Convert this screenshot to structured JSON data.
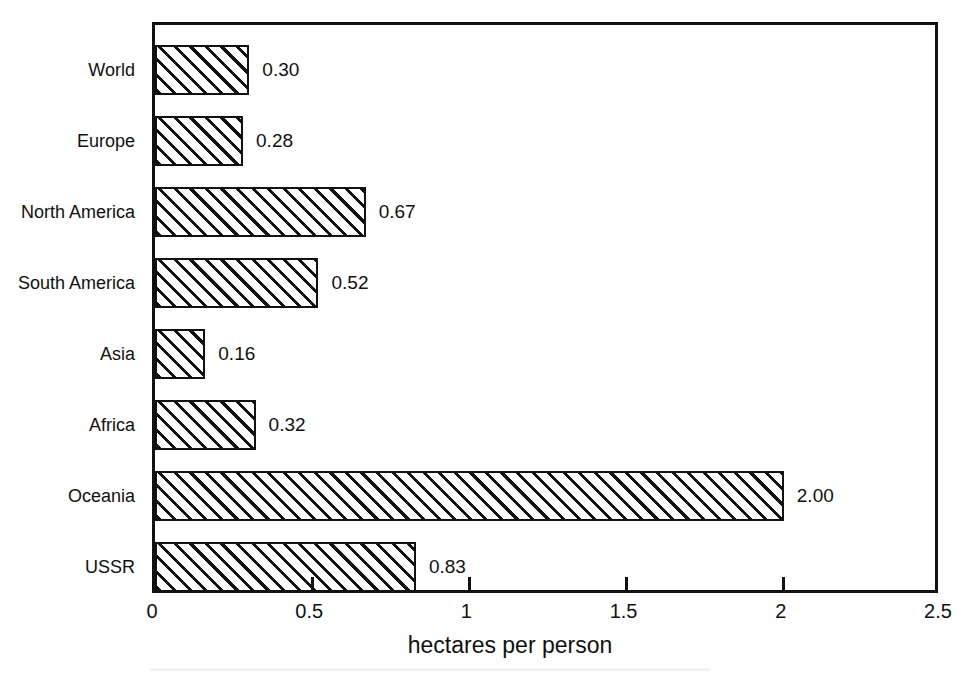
{
  "chart_data": {
    "type": "bar",
    "orientation": "horizontal",
    "title": "",
    "xlabel": "hectares per person",
    "ylabel": "",
    "xlim": [
      0,
      2.5
    ],
    "xticks": [
      "0",
      "0.5",
      "1",
      "1.5",
      "2",
      "2.5"
    ],
    "xtick_values": [
      0,
      0.5,
      1,
      1.5,
      2,
      2.5
    ],
    "grid": false,
    "legend": "none",
    "bar_style": "diagonal-hatch-45deg-black-on-white",
    "categories": [
      "World",
      "Europe",
      "North America",
      "South America",
      "Asia",
      "Africa",
      "Oceania",
      "USSR"
    ],
    "values": [
      0.3,
      0.28,
      0.67,
      0.52,
      0.16,
      0.32,
      2.0,
      0.83
    ],
    "value_labels": [
      "0.30",
      "0.28",
      "0.67",
      "0.52",
      "0.16",
      "0.32",
      "2.00",
      "0.83"
    ]
  },
  "colors": {
    "ink": "#111111",
    "page_background": "#fefefe",
    "plot_background": "#ffffff"
  }
}
